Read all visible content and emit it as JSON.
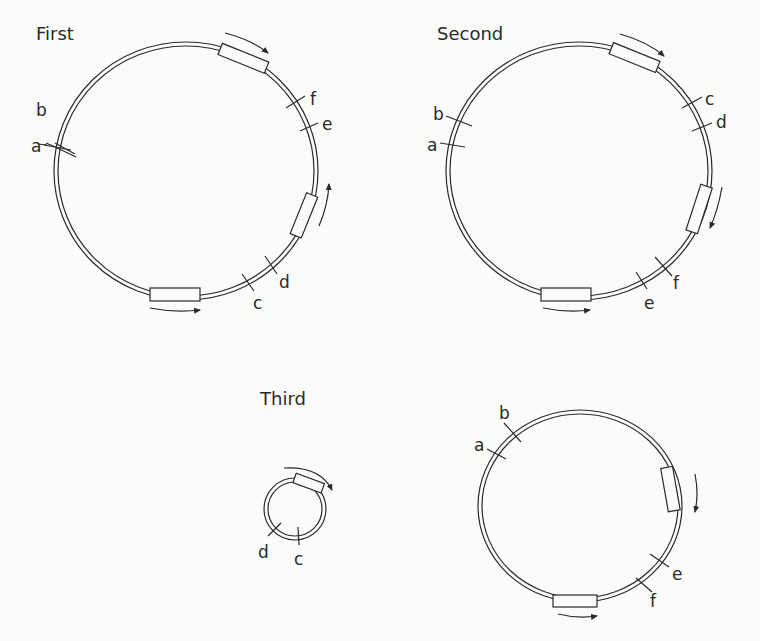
{
  "panels": [
    {
      "title": "First",
      "markers": [
        "a",
        "b",
        "c",
        "d",
        "e",
        "f"
      ]
    },
    {
      "title": "Second",
      "markers": [
        "a",
        "b",
        "c",
        "d",
        "e",
        "f"
      ]
    },
    {
      "title": "Third",
      "markers": [
        "c",
        "d"
      ]
    },
    {
      "title": "",
      "markers": [
        "a",
        "b",
        "e",
        "f"
      ]
    }
  ],
  "labels": {
    "first": {
      "title": "First",
      "a": "a",
      "b": "b",
      "c": "c",
      "d": "d",
      "e": "e",
      "f": "f"
    },
    "second": {
      "title": "Second",
      "a": "a",
      "b": "b",
      "c": "c",
      "d": "d",
      "e": "e",
      "f": "f"
    },
    "third": {
      "title": "Third",
      "c": "c",
      "d": "d"
    },
    "fourth": {
      "a": "a",
      "b": "b",
      "e": "e",
      "f": "f"
    }
  },
  "colors": {
    "line": "#2a2a2a",
    "background": "#fbfbf9"
  }
}
